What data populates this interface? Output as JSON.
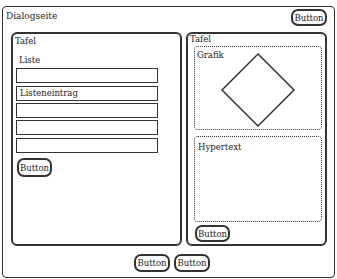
{
  "dialog": {
    "title": "Dialogseite",
    "top_button": "Button"
  },
  "left_panel": {
    "title": "Tafel",
    "list_label": "Liste",
    "list_items": [
      "",
      "Listeneintrag",
      "",
      "",
      ""
    ],
    "button": "Button"
  },
  "right_panel": {
    "title": "Tafel",
    "graphic_label": "Grafik",
    "hypertext_label": "Hypertext",
    "button": "Button"
  },
  "footer": {
    "buttons": [
      "Button",
      "Button"
    ]
  }
}
